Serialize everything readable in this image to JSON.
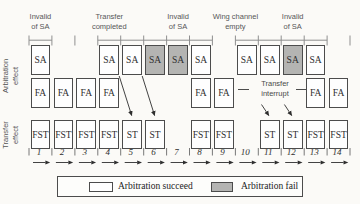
{
  "colors": {
    "succeed_fill": "#fefefe",
    "fail_fill": "#b4b4b2",
    "ink": "#4c4c4c",
    "tick": "#8f8f8f"
  },
  "row_labels": {
    "arbitration_line1": "Arbitration",
    "arbitration_line2": "effect",
    "transfer_line1": "Transfer",
    "transfer_line2": "effect"
  },
  "top_labels": [
    {
      "line1": "Invalid",
      "line2": "of SA",
      "col": 1
    },
    {
      "line1": "Transfer",
      "line2": "completed",
      "col": 4
    },
    {
      "line1": "Invalid",
      "line2": "of SA",
      "col": 7
    },
    {
      "line1": "Wing channel",
      "line2": "empty",
      "col": 9.5
    },
    {
      "line1": "Invalid",
      "line2": "of SA",
      "col": 12
    }
  ],
  "arbitration_row": {
    "sa_boxes": [
      {
        "col": 1,
        "label": "SA",
        "result": "succeed"
      },
      {
        "col": 4,
        "label": "SA",
        "result": "succeed"
      },
      {
        "col": 5,
        "label": "SA",
        "result": "succeed"
      },
      {
        "col": 6,
        "label": "SA",
        "result": "fail"
      },
      {
        "col": 7,
        "label": "SA",
        "result": "fail"
      },
      {
        "col": 8,
        "label": "SA",
        "result": "succeed"
      },
      {
        "col": 10,
        "label": "SA",
        "result": "succeed"
      },
      {
        "col": 11,
        "label": "SA",
        "result": "succeed"
      },
      {
        "col": 12,
        "label": "SA",
        "result": "fail"
      },
      {
        "col": 13,
        "label": "SA",
        "result": "succeed"
      }
    ],
    "fa_boxes": [
      {
        "col": 1,
        "label": "FA",
        "result": "succeed"
      },
      {
        "col": 2,
        "label": "FA",
        "result": "succeed"
      },
      {
        "col": 3,
        "label": "FA",
        "result": "succeed"
      },
      {
        "col": 4,
        "label": "FA",
        "result": "succeed"
      },
      {
        "col": 8,
        "label": "FA",
        "result": "succeed"
      },
      {
        "col": 9,
        "label": "FA",
        "result": "succeed"
      },
      {
        "col": 13,
        "label": "FA",
        "result": "succeed"
      },
      {
        "col": 14,
        "label": "FA",
        "result": "succeed"
      }
    ]
  },
  "transfer_row": {
    "boxes": [
      {
        "col": 1,
        "label": "FST"
      },
      {
        "col": 2,
        "label": "FST"
      },
      {
        "col": 3,
        "label": "FST"
      },
      {
        "col": 4,
        "label": "FST"
      },
      {
        "col": 5,
        "label": "ST"
      },
      {
        "col": 6,
        "label": "ST"
      },
      {
        "col": 8,
        "label": "FST"
      },
      {
        "col": 9,
        "label": "FST"
      },
      {
        "col": 11,
        "label": "ST"
      },
      {
        "col": 12,
        "label": "ST"
      },
      {
        "col": 13,
        "label": "FST"
      },
      {
        "col": 14,
        "label": "FST"
      }
    ]
  },
  "interrupt_note": {
    "line1": "Transfer",
    "line2": "interrupt",
    "span_cols": [
      10,
      12
    ]
  },
  "arrows": {
    "sa_to_st": [
      {
        "from_col": 4,
        "to_col": 5
      },
      {
        "from_col": 5,
        "to_col": 6
      }
    ],
    "interrupt_to_st": [
      {
        "to_col": 11
      },
      {
        "to_col": 12
      }
    ]
  },
  "sa_ruler_runs": [
    [
      1,
      1
    ],
    [
      4,
      8
    ],
    [
      10,
      13
    ]
  ],
  "timeline": {
    "slots": [
      "1",
      "2",
      "3",
      "4",
      "5",
      "6",
      "7",
      "8",
      "9",
      "10",
      "11",
      "12",
      "13",
      "14"
    ]
  },
  "legend": {
    "items": [
      {
        "label": "Arbitration succeed",
        "result": "succeed"
      },
      {
        "label": "Arbitration fail",
        "result": "fail"
      }
    ]
  }
}
